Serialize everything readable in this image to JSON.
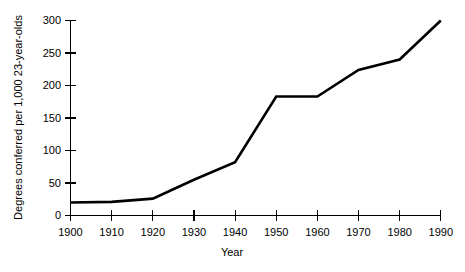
{
  "chart_data": {
    "type": "line",
    "title": "",
    "subtitle": "",
    "xlabel": "Year",
    "ylabel": "Degrees conferred per 1,000 23-year-olds",
    "x": [
      1900,
      1910,
      1920,
      1930,
      1940,
      1950,
      1960,
      1970,
      1980,
      1990
    ],
    "values": [
      20,
      21,
      26,
      55,
      82,
      183,
      183,
      224,
      240,
      300
    ],
    "series": [
      {
        "name": "Degrees conferred per 1,000 23-year-olds",
        "values": [
          20,
          21,
          26,
          55,
          82,
          183,
          183,
          224,
          240,
          300
        ],
        "color": "#000000"
      }
    ],
    "categories": [
      "1900",
      "1910",
      "1920",
      "1930",
      "1940",
      "1950",
      "1960",
      "1970",
      "1980",
      "1990"
    ],
    "xlim": [
      1900,
      1990
    ],
    "ylim": [
      0,
      300
    ],
    "xticks": [
      1900,
      1910,
      1920,
      1930,
      1940,
      1950,
      1960,
      1970,
      1980,
      1990
    ],
    "xtick_labels": [
      "1900",
      "1910",
      "1920",
      "1930",
      "1940",
      "1950",
      "1960",
      "1970",
      "1980",
      "1990"
    ],
    "yticks": [
      0,
      50,
      100,
      150,
      200,
      250,
      300
    ],
    "ytick_labels": [
      "0",
      "50",
      "100",
      "150",
      "200",
      "250",
      "300"
    ],
    "grid": false,
    "legend": false,
    "legend_position": "none",
    "annotations": []
  },
  "axes": {
    "y_axis_title": "Degrees conferred per 1,000 23-year-olds",
    "x_axis_title": "Year"
  },
  "colors": {
    "line": "#000000",
    "axis": "#000000",
    "background": "#ffffff",
    "text": "#000000"
  }
}
